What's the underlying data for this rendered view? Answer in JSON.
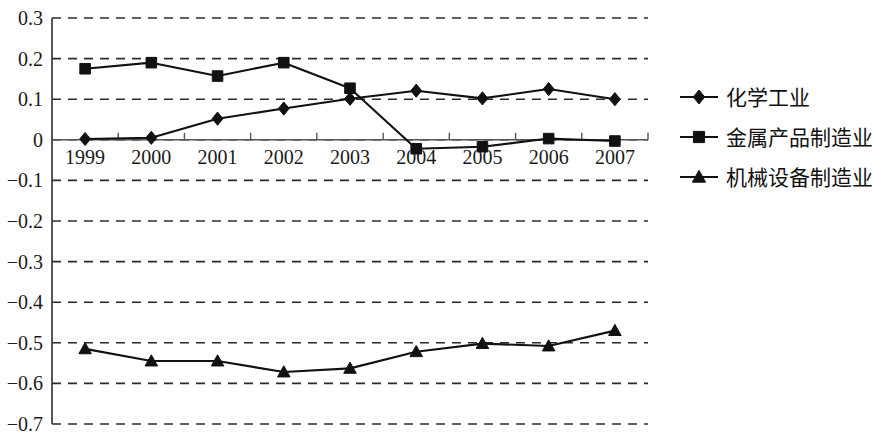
{
  "chart_data": {
    "type": "line",
    "title": "",
    "subtitle": "",
    "xlabel": "",
    "ylabel": "",
    "categories": [
      "1999",
      "2000",
      "2001",
      "2002",
      "2003",
      "2004",
      "2005",
      "2006",
      "2007"
    ],
    "ylim": [
      -0.7,
      0.3
    ],
    "ytick_labels": [
      "0.3",
      "0.2",
      "0.1",
      "0",
      "−0.1",
      "−0.2",
      "−0.3",
      "−0.4",
      "−0.5",
      "−0.6",
      "−0.7"
    ],
    "ytick_values": [
      0.3,
      0.2,
      0.1,
      0,
      -0.1,
      -0.2,
      -0.3,
      -0.4,
      -0.5,
      -0.6,
      -0.7
    ],
    "grid": true,
    "grid_style": "dashed-horizontal",
    "legend_position": "right",
    "series": [
      {
        "name": "化学工业",
        "marker": "diamond",
        "values": [
          0.002,
          0.005,
          0.052,
          0.077,
          0.101,
          0.121,
          0.102,
          0.125,
          0.1
        ]
      },
      {
        "name": "金属产品制造业",
        "marker": "square",
        "values": [
          0.175,
          0.19,
          0.157,
          0.19,
          0.127,
          -0.022,
          -0.017,
          0.003,
          -0.003
        ]
      },
      {
        "name": "机械设备制造业",
        "marker": "triangle",
        "values": [
          -0.515,
          -0.545,
          -0.545,
          -0.572,
          -0.563,
          -0.522,
          -0.502,
          -0.508,
          -0.47
        ]
      }
    ]
  },
  "legend": {
    "items": [
      {
        "label": "化学工业",
        "marker": "diamond"
      },
      {
        "label": "金属产品制造业",
        "marker": "square"
      },
      {
        "label": "机械设备制造业",
        "marker": "triangle"
      }
    ]
  },
  "colors": {
    "ink": "#111111",
    "grid": "#2b2b2b",
    "axis": "#3a3a3a",
    "background": "#ffffff"
  }
}
